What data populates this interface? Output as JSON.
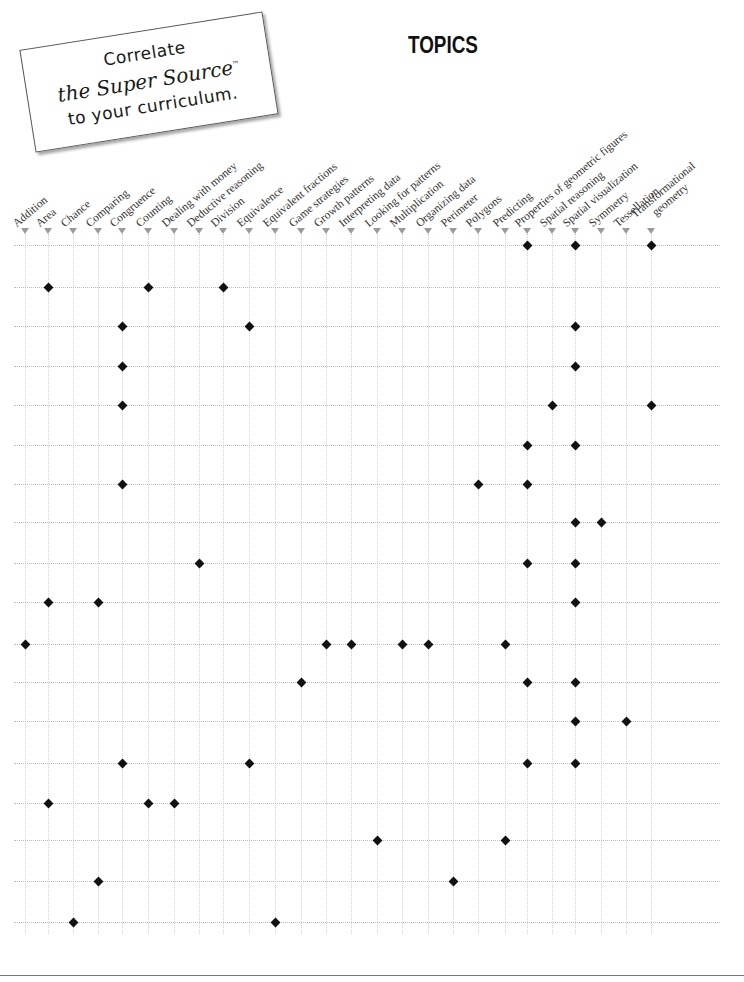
{
  "callout": {
    "line1": "Correlate",
    "line2": "the Super Source",
    "trademark": "™",
    "line3": "to your curriculum."
  },
  "header": {
    "title": "TOPICS"
  },
  "footer": {
    "page_number": ""
  },
  "topics": [
    {
      "label": "Addition",
      "x": 25
    },
    {
      "label": "Area",
      "x": 48
    },
    {
      "label": "Chance",
      "x": 73
    },
    {
      "label": "Comparing",
      "x": 98
    },
    {
      "label": "Congruence",
      "x": 122
    },
    {
      "label": "Counting",
      "x": 148
    },
    {
      "label": "Dealing with money",
      "x": 174
    },
    {
      "label": "Deductive reasoning",
      "x": 199
    },
    {
      "label": "Division",
      "x": 223
    },
    {
      "label": "Equivalence",
      "x": 249
    },
    {
      "label": "Equivalent fractions",
      "x": 275
    },
    {
      "label": "Game strategies",
      "x": 301
    },
    {
      "label": "Growth patterns",
      "x": 326
    },
    {
      "label": "Interpreting data",
      "x": 351
    },
    {
      "label": "Looking for patterns",
      "x": 377
    },
    {
      "label": "Multiplication",
      "x": 402
    },
    {
      "label": "Organizing data",
      "x": 428
    },
    {
      "label": "Perimeter",
      "x": 453
    },
    {
      "label": "Polygons",
      "x": 478
    },
    {
      "label": "Predicting",
      "x": 505
    },
    {
      "label": "Properties of geometric figures",
      "x": 527
    },
    {
      "label": "Spatial reasoning",
      "x": 552
    },
    {
      "label": "Spatial visualization",
      "x": 575
    },
    {
      "label": "Symmetry",
      "x": 601
    },
    {
      "label": "Tessellation",
      "x": 626
    },
    {
      "label": "Transformational\n      geometry",
      "x": 651
    }
  ],
  "rows": [
    {
      "y": 245,
      "topics": [
        "Properties of geometric figures",
        "Spatial visualization",
        "Transformational geometry"
      ]
    },
    {
      "y": 287,
      "topics": [
        "Area",
        "Counting",
        "Division"
      ]
    },
    {
      "y": 326,
      "topics": [
        "Congruence",
        "Equivalence",
        "Spatial visualization"
      ]
    },
    {
      "y": 366,
      "topics": [
        "Congruence",
        "Spatial visualization"
      ]
    },
    {
      "y": 405,
      "topics": [
        "Congruence",
        "Spatial reasoning",
        "Transformational geometry"
      ]
    },
    {
      "y": 445,
      "topics": [
        "Properties of geometric figures",
        "Spatial visualization"
      ]
    },
    {
      "y": 484,
      "topics": [
        "Congruence",
        "Polygons",
        "Properties of geometric figures"
      ]
    },
    {
      "y": 522,
      "topics": [
        "Spatial visualization",
        "Symmetry"
      ]
    },
    {
      "y": 563,
      "topics": [
        "Deductive reasoning",
        "Properties of geometric figures",
        "Spatial visualization"
      ]
    },
    {
      "y": 602,
      "topics": [
        "Area",
        "Comparing",
        "Spatial visualization"
      ]
    },
    {
      "y": 644,
      "topics": [
        "Addition",
        "Growth patterns",
        "Interpreting data",
        "Multiplication",
        "Organizing data",
        "Predicting"
      ]
    },
    {
      "y": 682,
      "topics": [
        "Game strategies",
        "Properties of geometric figures",
        "Spatial visualization"
      ]
    },
    {
      "y": 721,
      "topics": [
        "Spatial visualization",
        "Tessellation"
      ]
    },
    {
      "y": 763,
      "topics": [
        "Congruence",
        "Equivalence",
        "Properties of geometric figures",
        "Spatial visualization"
      ]
    },
    {
      "y": 803,
      "topics": [
        "Area",
        "Counting",
        "Dealing with money"
      ]
    },
    {
      "y": 840,
      "topics": [
        "Looking for patterns",
        "Predicting"
      ]
    },
    {
      "y": 881,
      "topics": [
        "Comparing",
        "Perimeter"
      ]
    },
    {
      "y": 922,
      "topics": [
        "Chance",
        "Equivalent fractions"
      ]
    }
  ],
  "colors": {
    "marker": "#111111",
    "arrow": "#9a9a9a",
    "gridline": "#c8c8c8"
  }
}
